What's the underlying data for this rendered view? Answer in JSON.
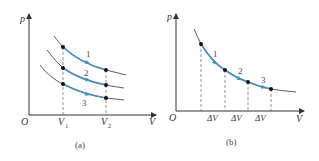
{
  "figure": {
    "colors": {
      "axis": "#333333",
      "curve": "#333333",
      "highlight": "#3a8fd0",
      "point": "#111111",
      "dashed": "#666666"
    },
    "panel_a": {
      "caption": "(a)",
      "origin_label": "O",
      "y_axis_label": "p",
      "x_axis_label": "V",
      "v1_label": "V",
      "v1_sub": "1",
      "v2_label": "V",
      "v2_sub": "2",
      "process_labels": [
        "1",
        "2",
        "3"
      ]
    },
    "panel_b": {
      "caption": "(b)",
      "origin_label": "O",
      "y_axis_label": "p",
      "x_axis_label": "V",
      "delta_labels": [
        "ΔV",
        "ΔV",
        "ΔV"
      ],
      "process_labels": [
        "1",
        "2",
        "3"
      ]
    }
  }
}
